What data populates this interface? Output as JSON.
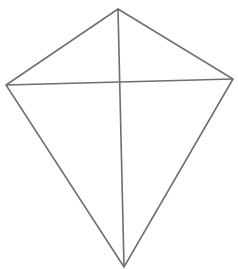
{
  "diagram": {
    "type": "kite",
    "stroke_color": "#6e6e6e",
    "background": "#ffffff",
    "stroke_width": 1.6,
    "vertices": {
      "top": [
        118,
        9
      ],
      "left": [
        6,
        85
      ],
      "right": [
        233,
        79
      ],
      "bottom": [
        124,
        267
      ]
    },
    "diagonals": [
      [
        "top",
        "bottom"
      ],
      [
        "left",
        "right"
      ]
    ]
  }
}
